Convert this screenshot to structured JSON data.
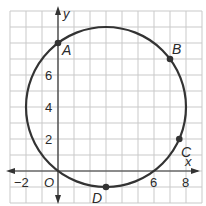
{
  "diagram": {
    "type": "coordinate-plane-circle",
    "axes": {
      "x_label": "x",
      "y_label": "y",
      "origin_label": "O",
      "x_tick_labels": [
        {
          "value": -2,
          "text": "−2"
        },
        {
          "value": 6,
          "text": "6"
        },
        {
          "value": 8,
          "text": "8"
        }
      ],
      "y_tick_labels": [
        {
          "value": 2,
          "text": "2"
        },
        {
          "value": 4,
          "text": "4"
        },
        {
          "value": 6,
          "text": "6"
        }
      ]
    },
    "circle": {
      "center": [
        3,
        4
      ],
      "radius": 5
    },
    "points": [
      {
        "label": "A",
        "x": 0,
        "y": 8
      },
      {
        "label": "B",
        "x": 7,
        "y": 7
      },
      {
        "label": "C",
        "x": 7.58,
        "y": 2
      },
      {
        "label": "D",
        "x": 3,
        "y": -1
      }
    ],
    "colors": {
      "grid": "#c9c9c9",
      "curve": "#333333",
      "axis": "#333333"
    }
  }
}
